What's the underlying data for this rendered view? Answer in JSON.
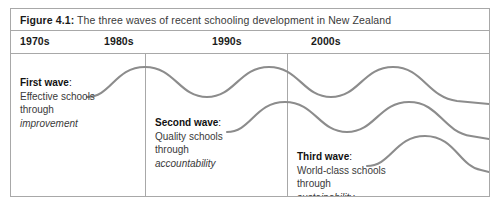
{
  "figure": {
    "caption_label": "Figure 4.1:",
    "caption_text": " The three waves of recent schooling development in New Zealand",
    "border_color": "#a8a8a8",
    "wave_stroke_color": "#8c8c8c",
    "background_color": "#ffffff"
  },
  "timeline": {
    "decades": [
      {
        "label": "1970s",
        "x": 9
      },
      {
        "label": "1980s",
        "x": 93
      },
      {
        "label": "1990s",
        "x": 201
      },
      {
        "label": "2000s",
        "x": 300
      }
    ],
    "dividers": [
      {
        "x": 134
      },
      {
        "x": 276
      }
    ]
  },
  "waves": [
    {
      "id": "first-wave",
      "heading": "First wave",
      "colon": ":",
      "line1": "Effective schools",
      "line2": "through",
      "emphasis": "improvement"
    },
    {
      "id": "second-wave",
      "heading": "Second wave",
      "colon": ":",
      "line1": "Quality schools",
      "line2": "through",
      "emphasis": "accountability"
    },
    {
      "id": "third-wave",
      "heading": "Third wave",
      "colon": ":",
      "line1": "World-class schools",
      "line2": "through",
      "emphasis": "sustainability"
    }
  ],
  "chart_data": {
    "type": "line",
    "title": "The three waves of recent schooling development in New Zealand",
    "xlabel": "",
    "ylabel": "",
    "categories": [
      "1970s",
      "1980s",
      "1990s",
      "2000s"
    ],
    "grid": false,
    "legend_position": "inline-annotations",
    "series": [
      {
        "name": "First wave",
        "path": "M 76 43 C 100 43 104 13 134 13 C 164 13 168 43 196 43 C 224 43 228 13 258 13 C 288 13 292 43 320 43 C 348 43 352 13 382 13 C 412 13 416 43 446 47 L 478 50"
      },
      {
        "name": "Second wave",
        "path": "M 216 78 C 240 78 244 48 274 48 C 304 48 308 78 336 78 C 364 78 368 48 398 48 C 428 48 432 78 460 82 L 478 85"
      },
      {
        "name": "Third wave",
        "path": "M 356 112 C 380 112 384 82 414 82 C 444 82 448 112 470 116 L 478 118"
      }
    ]
  }
}
